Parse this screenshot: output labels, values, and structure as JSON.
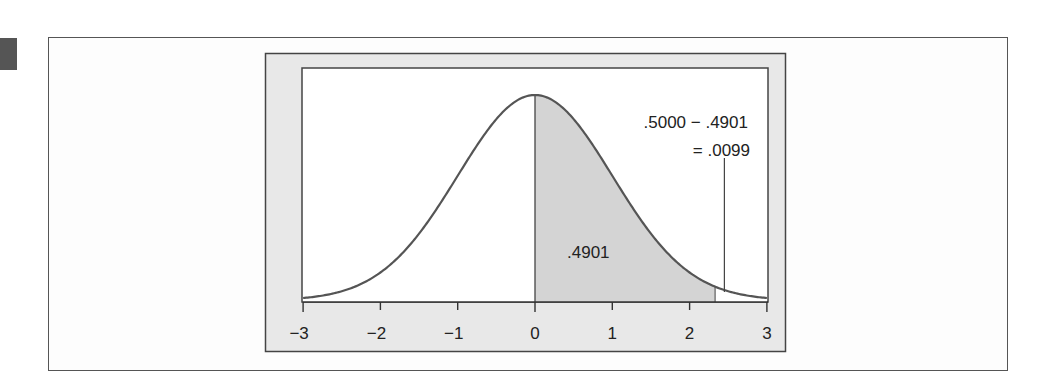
{
  "figure": {
    "marker_color": "#555555",
    "frame_fill": "#e8e8e8",
    "plot_fill": "#ffffff",
    "shade_fill": "#d4d4d4",
    "curve_color": "#555555"
  },
  "chart_data": {
    "type": "area",
    "title": "",
    "xlabel": "",
    "ylabel": "",
    "xlim": [
      -3,
      3
    ],
    "x_ticks": [
      -3,
      -2,
      -1,
      0,
      1,
      2,
      3
    ],
    "x_tick_labels": [
      "−3",
      "−2",
      "−1",
      "0",
      "1",
      "2",
      "3"
    ],
    "grid": false,
    "series": [
      {
        "name": "standard normal density",
        "mean": 0,
        "sd": 1
      }
    ],
    "shaded_region": {
      "from": 0,
      "to": 2.33,
      "area": 0.4901,
      "label": ".4901"
    },
    "annotations": [
      {
        "text_line1": ".5000 − .4901",
        "text_line2": "= .0099",
        "points_to_z": 2.45
      }
    ]
  }
}
